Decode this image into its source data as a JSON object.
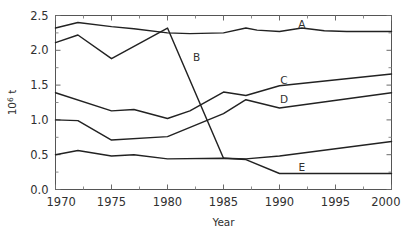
{
  "chart_data": {
    "type": "line",
    "title": "",
    "xlabel": "Year",
    "ylabel": "10^6 t",
    "ylabel_mantissa": "10",
    "ylabel_exponent": "6",
    "ylabel_unit": " t",
    "xlim": [
      1970,
      2000
    ],
    "ylim": [
      0.0,
      2.5
    ],
    "xticks": [
      1970,
      1975,
      1980,
      1985,
      1990,
      1995,
      2000
    ],
    "xticklabels": [
      "1970",
      "1975",
      "1980",
      "1985",
      "1990",
      "1995",
      "2000"
    ],
    "yticks": [
      0.0,
      0.5,
      1.0,
      1.5,
      2.0,
      2.5
    ],
    "yticklabels": [
      "0.0",
      "0.5",
      "1.0",
      "1.5",
      "2.0",
      "2.5"
    ],
    "y_minor_ticks": [
      0.25,
      0.75,
      1.25,
      1.75,
      2.25
    ],
    "x_minor_ticks": [
      1972.5,
      1977.5,
      1982.5,
      1987.5,
      1992.5,
      1997.5
    ],
    "grid": false,
    "legend_position": "inline-labels",
    "line_color": "#222222",
    "series": [
      {
        "name": "A",
        "label": "A",
        "label_x": 1992.0,
        "label_y": 2.38,
        "x": [
          1970,
          1972,
          1975,
          1977,
          1980,
          1982,
          1985,
          1987,
          1988,
          1990,
          1992,
          1994,
          1996,
          2000
        ],
        "values": [
          2.32,
          2.4,
          2.34,
          2.31,
          2.25,
          2.24,
          2.25,
          2.32,
          2.29,
          2.27,
          2.32,
          2.28,
          2.27,
          2.27
        ]
      },
      {
        "name": "B",
        "label": "B",
        "label_x": 1982.6,
        "label_y": 1.9,
        "x": [
          1970,
          1972,
          1975,
          1980,
          1985
        ],
        "values": [
          2.11,
          2.22,
          1.88,
          2.32,
          0.45
        ]
      },
      {
        "name": "C",
        "label": "C",
        "label_x": 1990.4,
        "label_y": 1.58,
        "x": [
          1970,
          1975,
          1977,
          1980,
          1982,
          1985,
          1987,
          1990,
          2000
        ],
        "values": [
          1.39,
          1.13,
          1.15,
          1.02,
          1.13,
          1.4,
          1.35,
          1.49,
          1.66
        ]
      },
      {
        "name": "D",
        "label": "D",
        "label_x": 1990.4,
        "label_y": 1.3,
        "x": [
          1970,
          1972,
          1975,
          1980,
          1985,
          1987,
          1990,
          2000
        ],
        "values": [
          1.0,
          0.99,
          0.71,
          0.76,
          1.09,
          1.29,
          1.17,
          1.39
        ]
      },
      {
        "name": "E",
        "label": "E",
        "label_x": 1992.0,
        "label_y": 0.33,
        "x": [
          1970,
          1972,
          1975,
          1977,
          1980,
          1985,
          1987,
          1990,
          2000
        ],
        "values": [
          0.5,
          0.56,
          0.48,
          0.5,
          0.44,
          0.45,
          0.43,
          0.23,
          0.23
        ]
      },
      {
        "name": "F",
        "label": "",
        "label_x": null,
        "label_y": null,
        "x": [
          1985,
          1987,
          1990,
          2000
        ],
        "values": [
          0.45,
          0.44,
          0.48,
          0.69
        ]
      }
    ]
  }
}
